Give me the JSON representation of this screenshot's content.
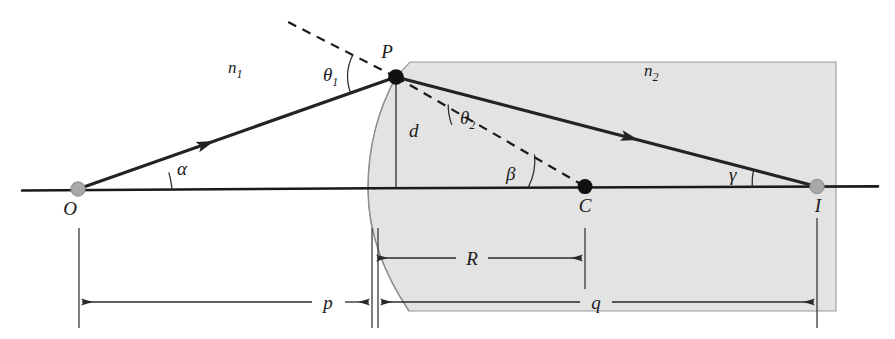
{
  "figure": {
    "type": "optics-ray-diagram",
    "width": 895,
    "height": 339,
    "background": "#ffffff",
    "medium_fill": "#e3e3e3"
  },
  "labels": {
    "n1": "n",
    "n1_sub": "1",
    "n2": "n",
    "n2_sub": "2",
    "theta1": "θ",
    "theta1_sub": "1",
    "theta2": "θ",
    "theta2_sub": "2",
    "alpha": "α",
    "beta": "β",
    "gamma": "γ",
    "point_O": "O",
    "point_P": "P",
    "point_C": "C",
    "point_I": "I",
    "dim_d": "d",
    "dim_p": "p",
    "dim_R": "R",
    "dim_q": "q"
  },
  "geometry": {
    "axis_y": 189,
    "object_O_x": 78,
    "vertex_x": 374,
    "center_C_x": 585,
    "image_I_x": 817,
    "point_P": {
      "x": 396,
      "y": 77
    },
    "dim_p_from": 79,
    "dim_p_to": 372,
    "dim_p_y": 302,
    "dim_R_from": 374,
    "dim_R_to": 585,
    "dim_R_y": 258,
    "dim_q_from": 378,
    "dim_q_to": 817,
    "dim_q_y": 302
  }
}
